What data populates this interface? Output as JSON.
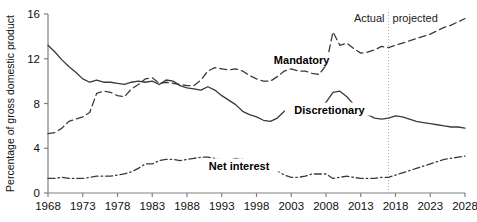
{
  "chart_data": {
    "type": "line",
    "title": "",
    "subtitle": "",
    "xlabel": "",
    "ylabel": "Percentage of gross domestic product",
    "xlim": [
      1968,
      2028
    ],
    "ylim": [
      0,
      16
    ],
    "yticks": [
      0,
      4,
      8,
      12,
      16
    ],
    "xticks": [
      1968,
      1973,
      1978,
      1983,
      1988,
      1993,
      1998,
      2003,
      2008,
      2013,
      2018,
      2023,
      2028
    ],
    "grid": false,
    "legend_position": "inline-annotations",
    "annotations": [
      {
        "name": "actual-label",
        "text": "Actual",
        "x": 2015.6,
        "y": 15.6
      },
      {
        "name": "projected-label",
        "text": "projected",
        "x": 2019.0,
        "y": 15.6
      },
      {
        "name": "divider-year",
        "text": "2017",
        "x": 2017,
        "style": "vertical-dotted"
      }
    ],
    "series": [
      {
        "name": "Mandatory",
        "style": "dashed",
        "label_x": 2004.5,
        "label_y": 11.5,
        "x": [
          1968,
          1969,
          1970,
          1971,
          1972,
          1973,
          1974,
          1975,
          1976,
          1977,
          1978,
          1979,
          1980,
          1981,
          1982,
          1983,
          1984,
          1985,
          1986,
          1987,
          1988,
          1989,
          1990,
          1991,
          1992,
          1993,
          1994,
          1995,
          1996,
          1997,
          1998,
          1999,
          2000,
          2001,
          2002,
          2003,
          2004,
          2005,
          2006,
          2007,
          2008,
          2009,
          2010,
          2011,
          2012,
          2013,
          2014,
          2015,
          2016,
          2017,
          2018,
          2019,
          2020,
          2021,
          2022,
          2023,
          2024,
          2025,
          2026,
          2027,
          2028
        ],
        "values": [
          5.3,
          5.4,
          5.8,
          6.4,
          6.6,
          6.8,
          7.2,
          8.9,
          9.1,
          9.0,
          8.7,
          8.6,
          9.3,
          9.7,
          10.2,
          10.3,
          9.8,
          9.9,
          9.8,
          9.7,
          9.6,
          9.6,
          10.1,
          10.9,
          11.2,
          11.1,
          11.0,
          11.1,
          10.9,
          10.5,
          10.2,
          10.0,
          10.0,
          10.4,
          10.9,
          11.1,
          10.9,
          10.9,
          10.7,
          10.6,
          11.4,
          14.4,
          13.2,
          13.4,
          12.9,
          12.5,
          12.6,
          12.8,
          13.1,
          13.0,
          13.2,
          13.4,
          13.6,
          13.8,
          14.0,
          14.2,
          14.5,
          14.8,
          15.0,
          15.3,
          15.6
        ]
      },
      {
        "name": "Discretionary",
        "style": "solid",
        "label_x": 2008.5,
        "label_y": 7.1,
        "x": [
          1968,
          1969,
          1970,
          1971,
          1972,
          1973,
          1974,
          1975,
          1976,
          1977,
          1978,
          1979,
          1980,
          1981,
          1982,
          1983,
          1984,
          1985,
          1986,
          1987,
          1988,
          1989,
          1990,
          1991,
          1992,
          1993,
          1994,
          1995,
          1996,
          1997,
          1998,
          1999,
          2000,
          2001,
          2002,
          2003,
          2004,
          2005,
          2006,
          2007,
          2008,
          2009,
          2010,
          2011,
          2012,
          2013,
          2014,
          2015,
          2016,
          2017,
          2018,
          2019,
          2020,
          2021,
          2022,
          2023,
          2024,
          2025,
          2026,
          2027,
          2028
        ],
        "values": [
          13.2,
          12.6,
          11.9,
          11.3,
          10.8,
          10.2,
          9.9,
          10.1,
          9.9,
          9.9,
          9.8,
          9.7,
          9.9,
          10.0,
          9.9,
          10.0,
          9.7,
          10.1,
          10.0,
          9.6,
          9.4,
          9.3,
          9.2,
          9.5,
          9.2,
          8.7,
          8.3,
          7.9,
          7.3,
          7.0,
          6.8,
          6.5,
          6.4,
          6.7,
          7.3,
          7.7,
          7.7,
          7.7,
          7.6,
          7.6,
          8.1,
          9.0,
          9.1,
          8.6,
          7.9,
          7.3,
          7.0,
          6.7,
          6.6,
          6.7,
          6.9,
          6.8,
          6.6,
          6.4,
          6.3,
          6.2,
          6.1,
          6.0,
          5.9,
          5.9,
          5.8
        ]
      },
      {
        "name": "Net interest",
        "style": "dash-dot",
        "label_x": 1995.5,
        "label_y": 2.1,
        "x": [
          1968,
          1969,
          1970,
          1971,
          1972,
          1973,
          1974,
          1975,
          1976,
          1977,
          1978,
          1979,
          1980,
          1981,
          1982,
          1983,
          1984,
          1985,
          1986,
          1987,
          1988,
          1989,
          1990,
          1991,
          1992,
          1993,
          1994,
          1995,
          1996,
          1997,
          1998,
          1999,
          2000,
          2001,
          2002,
          2003,
          2004,
          2005,
          2006,
          2007,
          2008,
          2009,
          2010,
          2011,
          2012,
          2013,
          2014,
          2015,
          2016,
          2017,
          2018,
          2019,
          2020,
          2021,
          2022,
          2023,
          2024,
          2025,
          2026,
          2027,
          2028
        ],
        "values": [
          1.3,
          1.3,
          1.4,
          1.3,
          1.3,
          1.3,
          1.4,
          1.5,
          1.5,
          1.5,
          1.6,
          1.7,
          1.9,
          2.2,
          2.6,
          2.6,
          2.9,
          3.0,
          3.0,
          2.9,
          3.0,
          3.1,
          3.2,
          3.2,
          3.1,
          2.9,
          2.9,
          3.1,
          3.0,
          2.9,
          2.7,
          2.5,
          2.3,
          2.0,
          1.6,
          1.4,
          1.4,
          1.5,
          1.7,
          1.7,
          1.7,
          1.3,
          1.4,
          1.5,
          1.4,
          1.3,
          1.3,
          1.3,
          1.4,
          1.4,
          1.6,
          1.8,
          2.0,
          2.2,
          2.4,
          2.6,
          2.8,
          3.0,
          3.1,
          3.2,
          3.3
        ]
      }
    ],
    "colors": {
      "axis": "#808080",
      "line": "#3a3a3a",
      "text": "#101010",
      "divider": "#b0b0b0",
      "background": "#ffffff"
    }
  }
}
